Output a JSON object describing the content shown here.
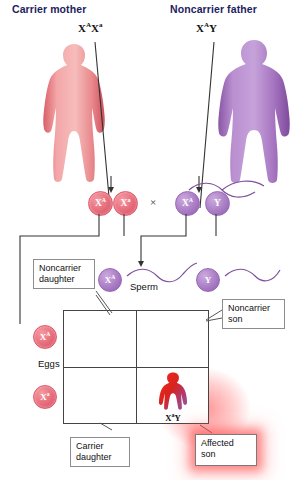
{
  "parents": {
    "mother": {
      "title": "Carrier mother",
      "genotype_allele1": "X",
      "genotype_sup1": "A",
      "genotype_allele2": "X",
      "genotype_sup2": "a",
      "color": "#e0707a",
      "figure_name": "female-body-icon"
    },
    "father": {
      "title": "Noncarrier father",
      "genotype_allele1": "X",
      "genotype_sup1": "A",
      "genotype_allele2": "Y",
      "genotype_sup2": "",
      "color": "#9b6bb8",
      "figure_name": "male-body-icon"
    }
  },
  "cross_symbol": "×",
  "gametes": {
    "eggs_label": "Eggs",
    "sperm_label": "Sperm",
    "maternal": [
      {
        "allele": "X",
        "sup": "A"
      },
      {
        "allele": "X",
        "sup": "a"
      }
    ],
    "paternal": [
      {
        "allele": "X",
        "sup": "A"
      },
      {
        "allele": "Y",
        "sup": ""
      }
    ],
    "egg_row_labels": [
      {
        "allele": "X",
        "sup": "A"
      },
      {
        "allele": "X",
        "sup": "a"
      }
    ]
  },
  "punnett": {
    "cells": [
      {
        "id": "top-left",
        "genotype": "X^A X^A",
        "a1": "X",
        "s1": "A",
        "a2": "X",
        "s2": "A",
        "sex": "daughter",
        "status": "noncarrier",
        "child_color": "#f1a0a6"
      },
      {
        "id": "top-right",
        "genotype": "X^A Y",
        "a1": "X",
        "s1": "A",
        "a2": "Y",
        "s2": "",
        "sex": "son",
        "status": "noncarrier",
        "child_color": "#ab80c6"
      },
      {
        "id": "bottom-left",
        "genotype": "X^A X^a",
        "a1": "X",
        "s1": "A",
        "a2": "X",
        "s2": "a",
        "sex": "daughter",
        "status": "carrier",
        "child_color": "#f1a0a6"
      },
      {
        "id": "bottom-right",
        "genotype": "X^a Y",
        "a1": "X",
        "s1": "a",
        "a2": "Y",
        "s2": "",
        "sex": "son",
        "status": "affected",
        "child_color": "#e2261f"
      }
    ]
  },
  "callouts": {
    "noncarrier_daughter": "Noncarrier\ndaughter",
    "noncarrier_son": "Noncarrier\nson",
    "carrier_daughter": "Carrier\ndaughter",
    "affected_son": "Affected\nson"
  },
  "colors": {
    "heading": "#1d2260",
    "mother": "#e0707a",
    "father": "#9b6bb8",
    "affected": "#e2261f",
    "box_border": "#8d8d8d",
    "grid": "#444444",
    "glow": "#ff4646"
  }
}
